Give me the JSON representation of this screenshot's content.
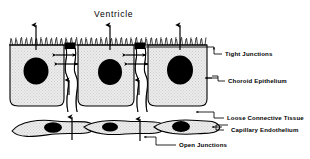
{
  "figure": {
    "title": "Ventricle",
    "colors": {
      "ink": "#000000",
      "cell_fill": "#e9e9e9",
      "nucleus": "#000000",
      "background": "#ffffff"
    },
    "labels": [
      {
        "id": "tight-junctions",
        "text": "Tight Junctions"
      },
      {
        "id": "choroid-epithelium",
        "text": "Choroid Epithelium"
      },
      {
        "id": "loose-connective-tissue",
        "text": "Loose Connective Tissue"
      },
      {
        "id": "capillary-endothelium",
        "text": "Capillary Endothelium"
      },
      {
        "id": "open-junctions",
        "text": "Open Junctions"
      }
    ],
    "structures": {
      "epithelial_cell_count": 3,
      "endothelial_cell_count": 3,
      "tight_junction_count": 2,
      "apical_border": "microvilli",
      "transport_arrows_apical": 3,
      "transport_arrows_lateral": 4,
      "transport_arrows_basal": 3
    }
  }
}
